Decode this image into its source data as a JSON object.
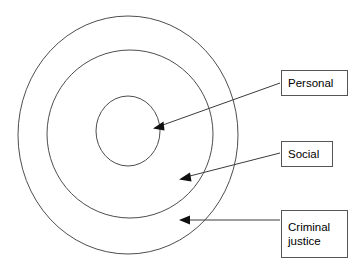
{
  "diagram": {
    "type": "concentric-circles",
    "title": "",
    "background_color": "#ffffff",
    "stroke_color": "#4d4d4d",
    "arrow_color": "#3b3b3b",
    "text_color": "#000000",
    "rings": [
      {
        "id": "outer",
        "label": "Criminal justice",
        "cx": 128,
        "cy": 135,
        "r": 110
      },
      {
        "id": "middle",
        "label": "Social",
        "cx": 130,
        "cy": 134,
        "r": 84
      },
      {
        "id": "inner",
        "label": "Personal",
        "cx": 128,
        "cy": 131,
        "r": 33
      }
    ],
    "callouts": [
      {
        "id": "personal",
        "lines": [
          "Personal"
        ],
        "arrow_from_x": 280,
        "arrow_from_y": 83,
        "arrow_to_x": 156,
        "arrow_to_y": 128
      },
      {
        "id": "social",
        "lines": [
          "Social"
        ],
        "arrow_from_x": 280,
        "arrow_from_y": 153,
        "arrow_to_x": 182,
        "arrow_to_y": 178
      },
      {
        "id": "criminal-justice",
        "lines": [
          "Criminal",
          "justice"
        ],
        "arrow_from_x": 280,
        "arrow_from_y": 220,
        "arrow_to_x": 182,
        "arrow_to_y": 220
      }
    ]
  },
  "labels": {
    "personal": {
      "line1": "Personal"
    },
    "social": {
      "line1": "Social"
    },
    "criminal_justice": {
      "line1": "Criminal",
      "line2": "justice"
    }
  }
}
